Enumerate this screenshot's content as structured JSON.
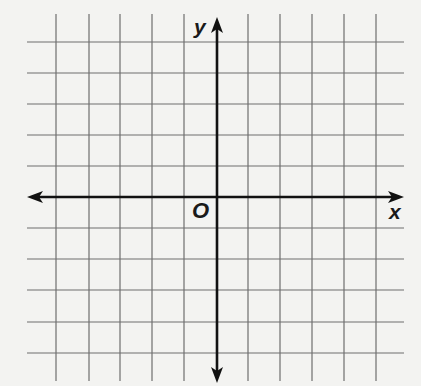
{
  "diagram": {
    "type": "coordinate-plane",
    "labels": {
      "x_axis": "x",
      "y_axis": "y",
      "origin": "O"
    },
    "grid": {
      "vertical_lines_x": [
        56,
        89,
        120,
        152,
        184,
        248,
        280,
        312,
        344,
        376
      ],
      "horizontal_lines_y": [
        42,
        73,
        104,
        135,
        166,
        228,
        259,
        290,
        322,
        353
      ],
      "x_extent": [
        27,
        404
      ],
      "y_extent": [
        14,
        381
      ],
      "columns": 12,
      "rows": 12
    },
    "axes": {
      "origin_px": [
        217,
        197
      ],
      "x_axis": {
        "from": 27,
        "to": 404,
        "arrows": "both"
      },
      "y_axis": {
        "from": 17,
        "to": 383,
        "arrows": "both"
      }
    },
    "colors": {
      "background": "#f3f3f1",
      "grid_line": "#6e6e6e",
      "axis": "#111111",
      "label": "#1a1a1a"
    }
  }
}
